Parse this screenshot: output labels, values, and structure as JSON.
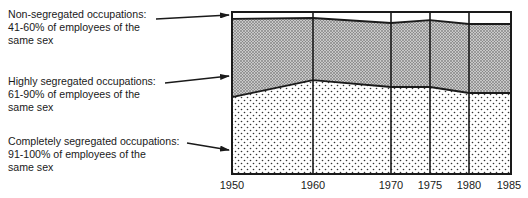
{
  "chart_data": {
    "type": "area",
    "stacked": true,
    "title": "",
    "xlabel": "",
    "ylabel": "",
    "x": [
      1950,
      1960,
      1970,
      1975,
      1980,
      1985
    ],
    "categories": [
      "1950",
      "1960",
      "1970",
      "1975",
      "1980",
      "1985"
    ],
    "ylim": [
      0,
      100
    ],
    "grid": false,
    "vertical_dividers_at": [
      1950,
      1960,
      1970,
      1975,
      1980,
      1985
    ],
    "legend_position": "left, arrows pointing to bands",
    "series": [
      {
        "name": "Completely segregated occupations: 91-100% of employees of the same sex",
        "pattern": "sparse dots",
        "values": [
          47.5,
          58,
          53.7,
          53.7,
          50,
          50
        ]
      },
      {
        "name": "Highly segregated occupations: 61-90% of employees of the same sex",
        "pattern": "dense dots",
        "values": [
          48.2,
          38.3,
          39.5,
          41.3,
          42.6,
          42.6
        ]
      },
      {
        "name": "Non-segregated occupations: 41-60% of employees of the same sex",
        "pattern": "white",
        "values": [
          4.3,
          3.7,
          6.8,
          5.0,
          7.4,
          7.4
        ]
      }
    ]
  },
  "labels": {
    "non_segregated": {
      "line1": "Non-segregated occupations:",
      "line2": "41-60% of employees of the",
      "line3": "same sex"
    },
    "highly_segregated": {
      "line1": "Highly segregated occupations:",
      "line2": "61-90% of employees of the",
      "line3": "same sex"
    },
    "completely_segregated": {
      "line1": "Completely segregated occupations:",
      "line2": "91-100% of employees of the",
      "line3": "same sex"
    }
  },
  "x_ticks": [
    "1950",
    "1960",
    "1970",
    "1975",
    "1980",
    "1985"
  ]
}
